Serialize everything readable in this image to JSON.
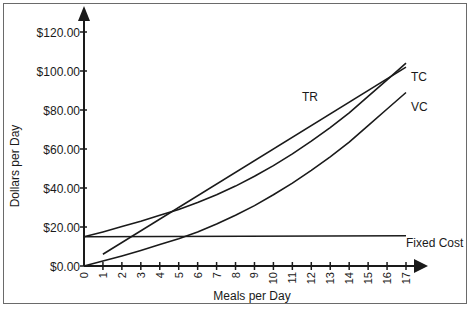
{
  "chart_data": {
    "type": "line",
    "title": "",
    "xlabel": "Meals per Day",
    "ylabel": "Dollars per Day",
    "xlim": [
      0,
      17
    ],
    "ylim": [
      0,
      120
    ],
    "grid": false,
    "legend_position": "inline labels at line ends",
    "x_ticks": [
      "0",
      "1",
      "2",
      "3",
      "4",
      "5",
      "6",
      "7",
      "8",
      "9",
      "10",
      "11",
      "12",
      "13",
      "14",
      "15",
      "16",
      "17"
    ],
    "y_ticks": [
      "$0.00",
      "$20.00",
      "$40.00",
      "$60.00",
      "$80.00",
      "$100.00",
      "$120.00"
    ],
    "y_tick_values": [
      0,
      20,
      40,
      60,
      80,
      100,
      120
    ],
    "series": [
      {
        "name": "TR",
        "x": [
          1,
          17
        ],
        "values": [
          6,
          102
        ]
      },
      {
        "name": "TC",
        "x": [
          0,
          1,
          2,
          3,
          4,
          5,
          6,
          7,
          8,
          9,
          10,
          11,
          12,
          13,
          14,
          15,
          16,
          17
        ],
        "values": [
          15,
          17.5,
          20.2,
          23,
          26,
          29,
          32.5,
          36.5,
          41,
          46,
          51.5,
          57.5,
          64,
          71,
          78.5,
          87,
          95.5,
          104
        ]
      },
      {
        "name": "VC",
        "x": [
          0,
          1,
          2,
          3,
          4,
          5,
          6,
          7,
          8,
          9,
          10,
          11,
          12,
          13,
          14,
          15,
          16,
          17
        ],
        "values": [
          0,
          2.5,
          5.2,
          8,
          11,
          14,
          17.5,
          21.5,
          26,
          31,
          36.5,
          42.5,
          49,
          56,
          63.5,
          72,
          80.5,
          89
        ]
      },
      {
        "name": "Fixed Cost",
        "x": [
          0,
          17
        ],
        "values": [
          15,
          15.5
        ]
      }
    ],
    "annotations": [
      {
        "text": "TR",
        "x_px": 302,
        "y_px": 101
      },
      {
        "text": "TC",
        "x_px": 411,
        "y_px": 81
      },
      {
        "text": "VC",
        "x_px": 411,
        "y_px": 111
      },
      {
        "text": "Fixed Cost",
        "x_px": 406,
        "y_px": 247
      }
    ]
  },
  "labels": {
    "xlabel": "Meals per Day",
    "ylabel": "Dollars per Day",
    "tr": "TR",
    "tc": "TC",
    "vc": "VC",
    "fixed_cost": "Fixed Cost"
  }
}
